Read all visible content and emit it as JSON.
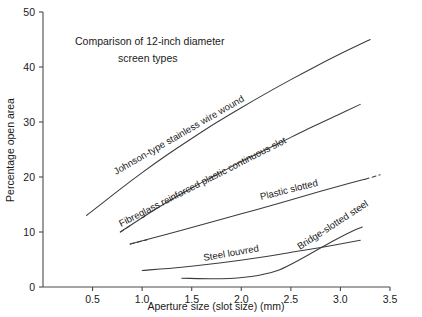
{
  "chart_data": {
    "type": "line",
    "title_line1": "Comparison of 12-inch diameter",
    "title_line2": "screen types",
    "xlabel": "Aperture size (slot size) (mm)",
    "ylabel": "Percentage open area",
    "xlim": [
      0,
      3.5
    ],
    "ylim": [
      0,
      50
    ],
    "xticks": [
      0.5,
      1.0,
      1.5,
      2.0,
      2.5,
      3.0,
      3.5
    ],
    "xtick_labels": [
      "0.5",
      "1.0",
      "1.5",
      "2.0",
      "2.5",
      "3.0",
      "3.5"
    ],
    "yticks": [
      0,
      10,
      20,
      30,
      40,
      50
    ],
    "ytick_labels": [
      "0",
      "10",
      "20",
      "30",
      "40",
      "50"
    ],
    "grid": false,
    "legend_position": "inline-curve-labels",
    "series": [
      {
        "name": "Johnson-type stainless wire wound",
        "label": "Johnson-type stainless wire wound",
        "style": "solid",
        "x": [
          0.44,
          0.75,
          1.0,
          1.25,
          1.5,
          1.75,
          2.0,
          2.25,
          2.5,
          2.75,
          3.0,
          3.3
        ],
        "y": [
          13.0,
          17.4,
          20.8,
          24.0,
          27.0,
          29.9,
          32.6,
          35.2,
          37.7,
          40.1,
          42.4,
          45.0
        ]
      },
      {
        "name": "Fibreglass reinforced plastic continuous slot",
        "label": "Fibreglass reinforced plastic continuous slot",
        "style": "solid-with-dashed-lead",
        "x": [
          0.78,
          1.0,
          1.25,
          1.5,
          1.75,
          2.0,
          2.25,
          2.5,
          2.75,
          3.0,
          3.2
        ],
        "y": [
          10.0,
          12.6,
          15.4,
          18.0,
          20.4,
          22.8,
          25.0,
          27.2,
          29.4,
          31.5,
          33.2
        ],
        "dashed_lead_x": [
          0.78,
          0.9
        ],
        "dashed_lead_y": [
          10.0,
          11.4
        ]
      },
      {
        "name": "Plastic slotted",
        "label": "Plastic slotted",
        "style": "solid-with-dashed-ends",
        "x": [
          0.88,
          1.25,
          1.6,
          2.0,
          2.4,
          2.8,
          3.1,
          3.25
        ],
        "y": [
          7.8,
          9.6,
          11.3,
          13.3,
          15.3,
          17.4,
          18.9,
          19.6
        ],
        "dashed_lead_x": [
          0.88,
          1.05
        ],
        "dashed_lead_y": [
          7.8,
          8.6
        ],
        "dashed_tail_x": [
          3.25,
          3.4
        ],
        "dashed_tail_y": [
          19.6,
          20.4
        ]
      },
      {
        "name": "Steel louvred",
        "label": "Steel louvred",
        "style": "solid",
        "x": [
          1.0,
          1.4,
          1.8,
          2.2,
          2.6,
          2.9,
          3.2
        ],
        "y": [
          3.0,
          3.6,
          4.4,
          5.4,
          6.6,
          7.5,
          8.5
        ]
      },
      {
        "name": "Bridge-slotted steel",
        "label": "Bridge-slotted steel",
        "style": "solid",
        "x": [
          1.4,
          1.8,
          2.1,
          2.35,
          2.55,
          2.75,
          2.95,
          3.15,
          3.22
        ],
        "y": [
          1.6,
          1.5,
          1.9,
          2.9,
          4.6,
          6.6,
          8.6,
          10.4,
          10.9
        ]
      }
    ],
    "series_labels": [
      {
        "text": "Johnson-type stainless wire wound",
        "x": 116,
        "y": 175,
        "rotation": -30
      },
      {
        "text": "Fibreglass reinforced plastic continuous slot",
        "x": 121,
        "y": 227,
        "rotation": -27
      },
      {
        "text": "Plastic slotted",
        "x": 261,
        "y": 200,
        "rotation": -14
      },
      {
        "text": "Steel louvred",
        "x": 204,
        "y": 261,
        "rotation": -10
      },
      {
        "text": "Bridge-slotted steel",
        "x": 300,
        "y": 250,
        "rotation": -33
      }
    ],
    "colors": {
      "line": "#3c3c3c",
      "axis": "#4a4a4a",
      "text": "#1a1a1a",
      "background": "#ffffff"
    }
  }
}
